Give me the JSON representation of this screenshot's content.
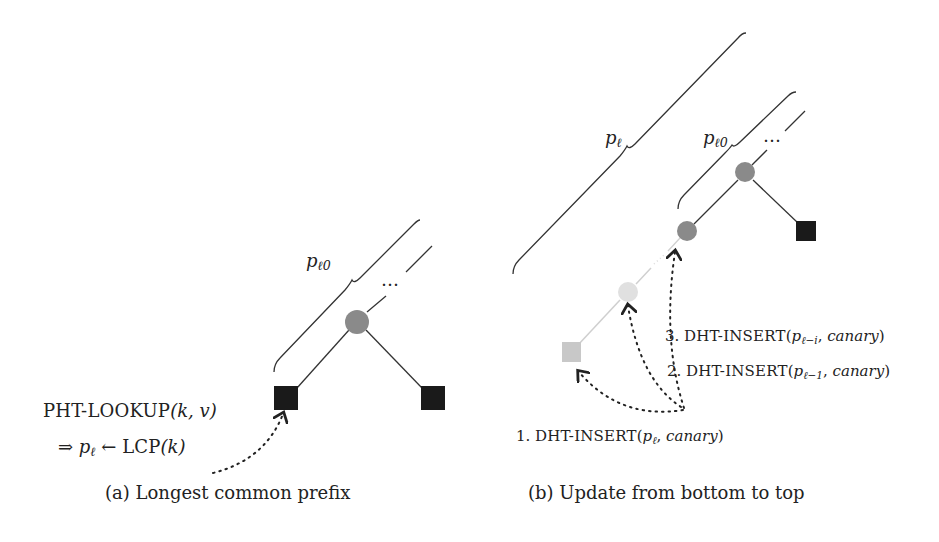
{
  "figure": {
    "left": {
      "caption": "(a) Longest common prefix",
      "brace_label": "p",
      "brace_label_sub": "ℓ0",
      "ellipsis": "…",
      "op_line1_name": "PHT-LOOKUP",
      "op_line1_args": "(k, v)",
      "op_line2_prefix": "⇒ ",
      "op_line2_var": "p",
      "op_line2_sub": "ℓ",
      "op_line2_arrow": " ← ",
      "op_line2_fn": "LCP",
      "op_line2_args": "(k)"
    },
    "right": {
      "caption": "(b) Update from bottom to top",
      "brace_outer_label": "p",
      "brace_outer_sub": "ℓ",
      "brace_inner_label": "p",
      "brace_inner_sub": "ℓ0",
      "ellipsis": "…",
      "steps": [
        {
          "num": "1.",
          "name": "DHT-INSERT",
          "var": "p",
          "sub": "ℓ",
          "arg2": "canary"
        },
        {
          "num": "2.",
          "name": "DHT-INSERT",
          "var": "p",
          "sub": "ℓ−1",
          "arg2": "canary"
        },
        {
          "num": "3.",
          "name": "DHT-INSERT",
          "var": "p",
          "sub": "ℓ−i",
          "arg2": "canary"
        }
      ]
    },
    "colors": {
      "internal_node": "#8a8a8a",
      "leaf_node": "#1a1a1a",
      "faded_node": "#e0e0e0",
      "faded_leaf": "#c8c8c8",
      "edge": "#333333",
      "faded_edge": "#cfcfcf"
    }
  }
}
